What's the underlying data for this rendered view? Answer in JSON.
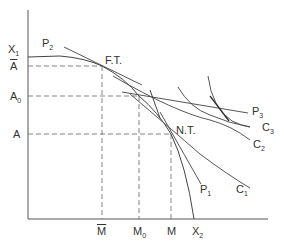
{
  "diagram": {
    "axes": {
      "y_labels": [
        {
          "id": "X1",
          "text": "X",
          "sub": "1"
        },
        {
          "id": "Abar",
          "text": "A",
          "bar": true
        },
        {
          "id": "A0",
          "text": "A",
          "sub": "0"
        },
        {
          "id": "A",
          "text": "A"
        }
      ],
      "x_labels": [
        {
          "id": "Mbar",
          "text": "M",
          "bar": true
        },
        {
          "id": "M0",
          "text": "M",
          "sub": "0"
        },
        {
          "id": "M",
          "text": "M"
        },
        {
          "id": "X2",
          "text": "X",
          "sub": "2"
        }
      ]
    },
    "curves": [
      {
        "id": "P2",
        "text": "P",
        "sub": "2"
      },
      {
        "id": "P1",
        "text": "P",
        "sub": "1"
      },
      {
        "id": "P3",
        "text": "P",
        "sub": "3"
      },
      {
        "id": "C1",
        "text": "C",
        "sub": "1"
      },
      {
        "id": "C2",
        "text": "C",
        "sub": "2"
      },
      {
        "id": "C3",
        "text": "C",
        "sub": "3"
      }
    ],
    "points": [
      {
        "id": "FT",
        "text": "F.T."
      },
      {
        "id": "NT",
        "text": "N.T."
      }
    ],
    "colors": {
      "line": "#444444",
      "dash": "#777777"
    }
  }
}
